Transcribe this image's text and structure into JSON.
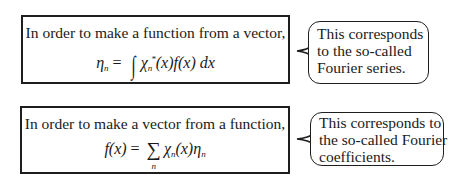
{
  "panels": [
    {
      "box": {
        "intro": "In order to make a function from a vector,",
        "formula": {
          "lhs": "η",
          "lhs_sub": "n",
          "equals": "=",
          "operator": "∫",
          "term1": "χ",
          "term1_sub": "n",
          "term1_sup": "*",
          "term1_arg": "(x)",
          "term2": "f(x)",
          "differential": "dx"
        }
      },
      "callout": {
        "lines": [
          "This corresponds",
          "to the so-called",
          "Fourier series."
        ]
      }
    },
    {
      "box": {
        "intro": "In order to make a vector from a function,",
        "formula": {
          "lhs": "f(x)",
          "equals": "=",
          "operator": "∑",
          "operator_sub": "n",
          "term1": "χ",
          "term1_sub": "n",
          "term1_arg": "(x)",
          "term2": "η",
          "term2_sub": "n"
        }
      },
      "callout": {
        "lines": [
          "This corresponds to",
          "the so-called Fourier",
          "coefficients."
        ]
      }
    }
  ],
  "colors": {
    "stroke": "#1e1e1e",
    "text": "#1a1a1a",
    "background": "#ffffff"
  }
}
